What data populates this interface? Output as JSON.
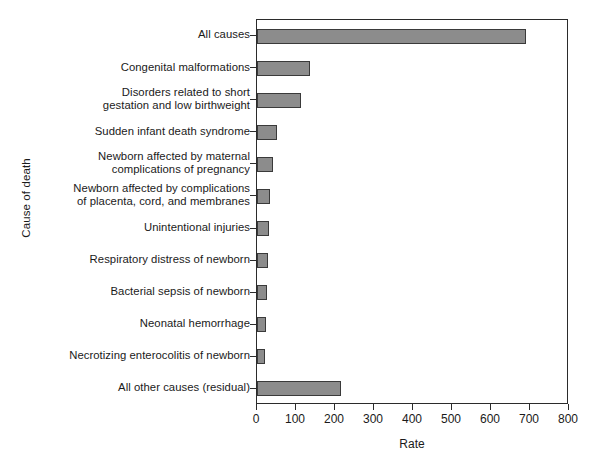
{
  "chart_data": {
    "type": "bar",
    "orientation": "horizontal",
    "title": "",
    "xlabel": "Rate",
    "ylabel": "Cause of death",
    "xlim": [
      0,
      800
    ],
    "xticks": [
      0,
      100,
      200,
      300,
      400,
      500,
      600,
      700,
      800
    ],
    "grid": false,
    "legend": null,
    "bar_color": "#8c8c8c",
    "bar_edge_color": "#3a3a3a",
    "categories": [
      "All causes",
      "Congenital malformations",
      "Disorders related to short\ngestation and low birthweight",
      "Sudden infant death syndrome",
      "Newborn affected by maternal\ncomplications of pregnancy",
      "Newborn affected by complications\nof placenta, cord, and membranes",
      "Unintentional injuries",
      "Respiratory distress of newborn",
      "Bacterial sepsis of newborn",
      "Neonatal hemorrhage",
      "Necrotizing enterocolitis of newborn",
      "All other causes (residual)"
    ],
    "values": [
      690,
      136,
      113,
      52,
      41,
      34,
      30,
      28,
      26,
      23,
      21,
      215
    ]
  }
}
